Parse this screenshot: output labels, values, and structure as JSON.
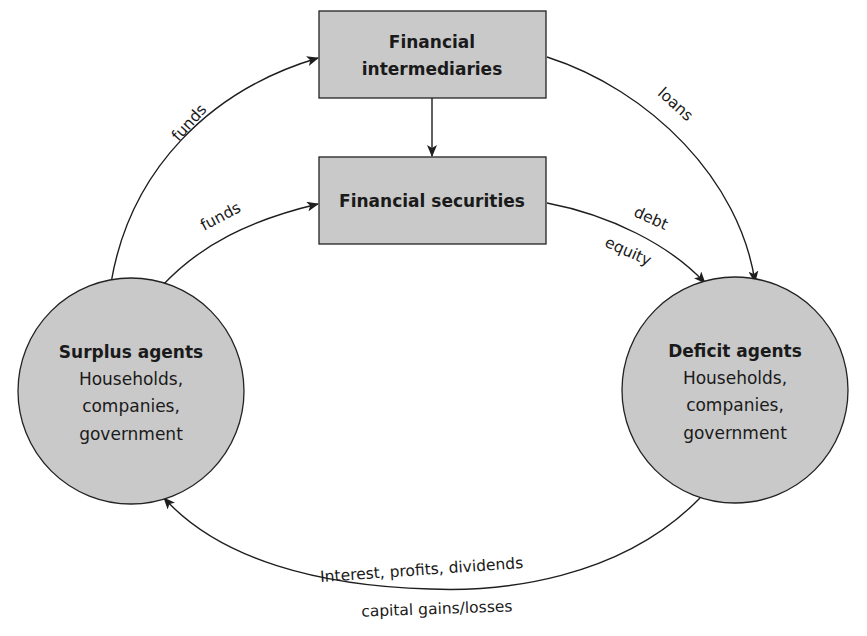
{
  "diagram": {
    "nodes": {
      "intermediaries": {
        "line1": "Financial",
        "line2": "intermediaries"
      },
      "securities": {
        "label": "Financial securities"
      },
      "surplus": {
        "title": "Surplus agents",
        "line1": "Households,",
        "line2": "companies,",
        "line3": "government"
      },
      "deficit": {
        "title": "Deficit agents",
        "line1": "Households,",
        "line2": "companies,",
        "line3": "government"
      }
    },
    "edges": {
      "surplus_to_intermediaries": "funds",
      "surplus_to_securities": "funds",
      "intermediaries_to_deficit": "loans",
      "securities_to_deficit_top": "debt",
      "securities_to_deficit_bottom": "equity",
      "return_flow_top": "Interest, profits, dividends",
      "return_flow_bottom": "capital gains/losses"
    },
    "colors": {
      "node_fill": "#c9c9c9",
      "stroke": "#1e1e1e",
      "background": "#ffffff"
    }
  }
}
